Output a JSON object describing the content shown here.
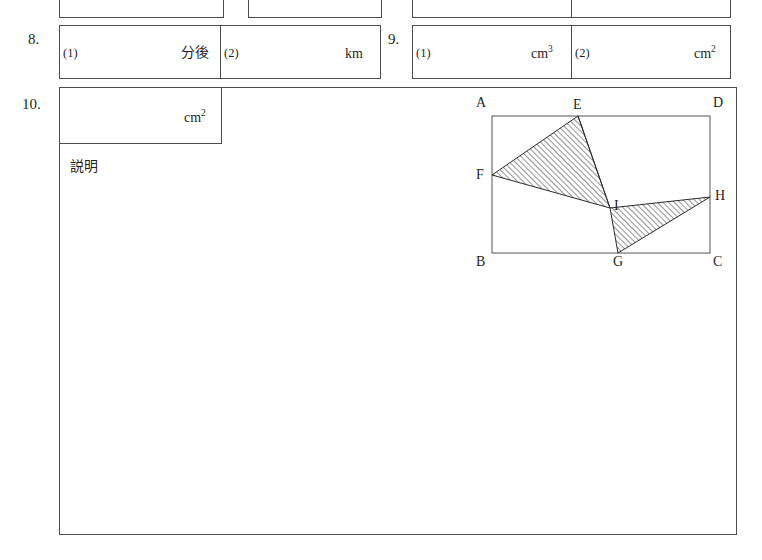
{
  "page": {
    "background": "#ffffff",
    "ink": "#1f1f1f",
    "rule": "#4a4a4a"
  },
  "rows": {
    "row7_partial": {
      "note_visible_text": ""
    },
    "row8": {
      "number": "8.",
      "cells": [
        {
          "label": "(1)",
          "unit": "分後",
          "unit_sup": ""
        },
        {
          "label": "(2)",
          "unit": "km",
          "unit_sup": ""
        }
      ]
    },
    "row9": {
      "number": "9.",
      "cells": [
        {
          "label": "(1)",
          "unit": "cm",
          "unit_sup": "3"
        },
        {
          "label": "(2)",
          "unit": "cm",
          "unit_sup": "2"
        }
      ]
    },
    "row10": {
      "number": "10.",
      "answer_unit": "cm",
      "answer_unit_sup": "2",
      "explanation_label": "説明"
    }
  },
  "figure": {
    "name": "rectangle-abcd-with-hatched-triangles",
    "rect_labels": {
      "top_left": "A",
      "top_right": "D",
      "bottom_left": "B",
      "bottom_right": "C"
    },
    "point_labels": {
      "E": "E",
      "F": "F",
      "G": "G",
      "H": "H",
      "I": "I"
    },
    "label_positions": {
      "A": {
        "x": 10,
        "y": 6
      },
      "D": {
        "x": 238,
        "y": 6
      },
      "B": {
        "x": 10,
        "y": 158
      },
      "C": {
        "x": 238,
        "y": 158
      },
      "E": {
        "x": 100,
        "y": 4
      },
      "F": {
        "x": 7,
        "y": 72
      },
      "G": {
        "x": 140,
        "y": 159
      },
      "H": {
        "x": 242,
        "y": 93
      },
      "I": {
        "x": 142,
        "y": 103
      }
    },
    "rect": {
      "x": 22,
      "y": 21,
      "w": 218,
      "h": 137
    },
    "points": {
      "E": {
        "x": 108,
        "y": 21
      },
      "F": {
        "x": 22,
        "y": 80
      },
      "G": {
        "x": 148,
        "y": 158
      },
      "H": {
        "x": 240,
        "y": 102
      },
      "I": {
        "x": 140,
        "y": 113
      }
    },
    "shaded_polygons": [
      {
        "name": "triangle-EFI",
        "vertices": [
          "E",
          "F",
          "I"
        ]
      },
      {
        "name": "triangle-IGH",
        "vertices": [
          "I",
          "G",
          "H"
        ]
      }
    ],
    "hatch": {
      "direction": "forward-diagonal-45",
      "color": "#2b2b2b",
      "spacing_px": 4
    }
  }
}
